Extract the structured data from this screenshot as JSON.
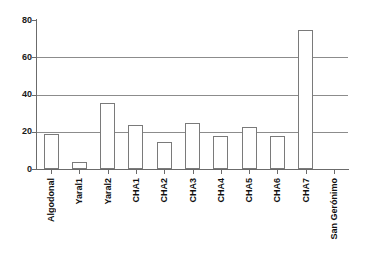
{
  "chart_data": {
    "type": "bar",
    "title": "",
    "subtitle": "",
    "xlabel": "",
    "ylabel": "",
    "categories": [
      "Algodonal",
      "Yaral1",
      "Yaral2",
      "CHA1",
      "CHA2",
      "CHA3",
      "CHA4",
      "CHA5",
      "CHA6",
      "CHA7",
      "San Gerónimo"
    ],
    "values": [
      19,
      4,
      35.5,
      23.5,
      14.5,
      24.5,
      17.5,
      22.5,
      17.5,
      74.5,
      0
    ],
    "ylim": [
      0,
      80
    ],
    "yticks": [
      0,
      20,
      40,
      60,
      80
    ],
    "ytick_labels": [
      "0",
      "20",
      "40",
      "60",
      "80"
    ],
    "grid": "horizontal",
    "legend": "none",
    "bar_fill": "#ffffff",
    "bar_edge": "#7a7a7a",
    "axis_color": "#6b6b6b",
    "grid_color": "#8c8c8c",
    "background": "#ffffff"
  }
}
